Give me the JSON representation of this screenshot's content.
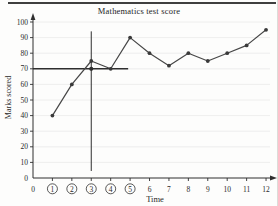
{
  "figure": {
    "title": "Mathematics test score",
    "x_axis_label": "Time",
    "y_axis_label": "Marks scored"
  },
  "chart_data": {
    "type": "line",
    "title": "Mathematics test score",
    "xlabel": "Time",
    "ylabel": "Marks scored",
    "x": [
      1,
      2,
      3,
      4,
      5,
      6,
      7,
      8,
      9,
      10,
      11,
      12
    ],
    "values": [
      40,
      60,
      75,
      70,
      90,
      80,
      72,
      80,
      75,
      80,
      85,
      95
    ],
    "xlim": [
      0,
      12
    ],
    "ylim": [
      0,
      100
    ],
    "x_ticks": [
      0,
      1,
      2,
      3,
      4,
      5,
      6,
      7,
      8,
      9,
      10,
      11,
      12
    ],
    "circled_x_ticks": [
      1,
      2,
      3,
      4,
      5
    ],
    "y_ticks": [
      0,
      10,
      20,
      30,
      40,
      50,
      60,
      70,
      80,
      90,
      100
    ],
    "grid": "horizontal",
    "legend": "none",
    "reference_lines": {
      "vertical": {
        "x": 3,
        "y_from": 4.5,
        "y_to": 94
      },
      "horizontal": {
        "y": 70,
        "x_from": 0,
        "x_to": 4.9
      },
      "intersection_point": {
        "x": 3,
        "y": 70
      }
    },
    "colors": {
      "line": "#474747",
      "marker": "#3a3a3a",
      "axis": "#2f2f2f",
      "grid": "#eaeaea",
      "reference": "#2f2f2f",
      "tick_text": "#2a2a2a"
    }
  }
}
